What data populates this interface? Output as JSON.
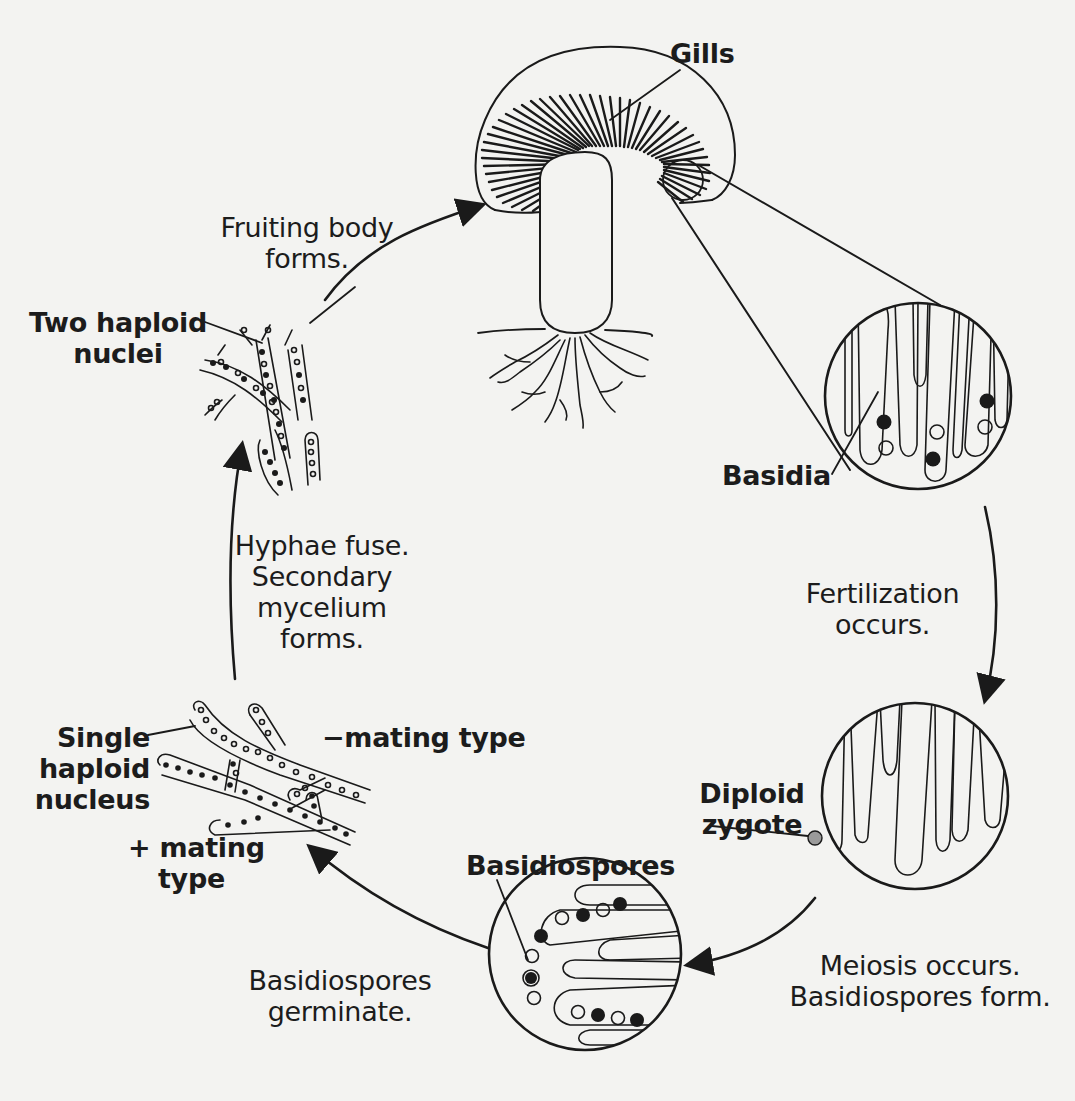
{
  "diagram": {
    "colors": {
      "ink": "#1a1a1a",
      "paper": "#f3f3f1",
      "zygote_fill": "#9a9a9a"
    },
    "structure_labels": {
      "gills": "Gills",
      "basidia": "Basidia",
      "diploid_zygote_line1": "Diploid",
      "diploid_zygote_line2": "zygote",
      "basidiospores": "Basidiospores",
      "two_haploid_nuclei_line1": "Two haploid",
      "two_haploid_nuclei_line2": "nuclei",
      "single_haploid_nucleus_line1": "Single",
      "single_haploid_nucleus_line2": "haploid",
      "single_haploid_nucleus_line3": "nucleus",
      "minus_mating_type": "−mating type",
      "plus_mating_type_line1": "+ mating",
      "plus_mating_type_line2": "type"
    },
    "steps": [
      {
        "line1": "Fruiting body",
        "line2": "forms."
      },
      {
        "line1": "Fertilization",
        "line2": "occurs."
      },
      {
        "line1": "Meiosis occurs.",
        "line2": "Basidiospores form."
      },
      {
        "line1": "Basidiospores",
        "line2": "germinate."
      },
      {
        "line1": "Hyphae fuse.",
        "line2": "Secondary",
        "line3": "mycelium",
        "line4": "forms."
      }
    ],
    "icons": [
      "mushroom-icon",
      "basidia-magnified-icon",
      "zygote-magnified-icon",
      "basidiospores-magnified-icon",
      "primary-mycelium-icon",
      "secondary-mycelium-icon",
      "cycle-arrow-icon"
    ]
  }
}
